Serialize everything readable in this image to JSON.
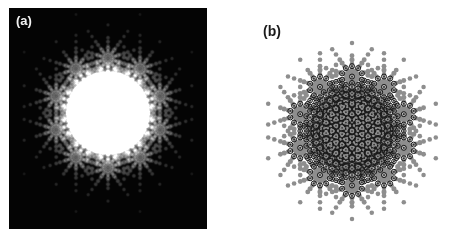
{
  "figure": {
    "width": 459,
    "height": 240,
    "background_color": "#ffffff",
    "type": "two-panel scientific figure of a decagonal quasicrystal diffraction pattern"
  },
  "panels": [
    {
      "id": "a",
      "label": "(a)",
      "label_color": "#f2f2f2",
      "kind": "experimental-electron-diffraction",
      "background_color": "#040404",
      "spot_color": "#f0f0f0",
      "rect": {
        "x": 9,
        "y": 8,
        "width": 198,
        "height": 221
      },
      "center": {
        "x": 99,
        "y": 105
      },
      "halo": {
        "radius": 34,
        "peak_brightness": 0.78
      }
    },
    {
      "id": "b",
      "label": "(b)",
      "label_color": "#1a1a1a",
      "kind": "calculated-indexed-pattern",
      "background_color": "#ffffff",
      "dot_color": "#111111",
      "ring_color": "#1a1a1a",
      "ring_fill_color": "#8e8e8e",
      "rect": {
        "x": 247,
        "y": 20,
        "width": 212,
        "height": 220
      },
      "center": {
        "x": 105,
        "y": 111
      },
      "radius": 99
    }
  ],
  "chart_data": {
    "type": "scatter",
    "xlabel": "",
    "ylabel": "",
    "symmetry_order": 10,
    "grid": false,
    "legend": null,
    "lattice": {
      "description": "Reciprocal-space quasilattice generated from five unit vectors at 72-degree increments, with amplitudes scaled by powers of the golden ratio tau = 1.618034",
      "basis_angles_deg": [
        90,
        162,
        234,
        306,
        18
      ],
      "golden_ratio": 1.618034,
      "base_spacing_px": 10.4,
      "tau_powers": [
        -2,
        -1,
        0,
        1,
        2
      ],
      "index_range": [
        -2,
        -1,
        0,
        1,
        2
      ]
    },
    "series": [
      {
        "name": "panel-a-spots",
        "marker": "blurred-gaussian-disc",
        "color": "#f0f0f0",
        "intensity_rule": "intensity falls with distance from the origin; spot radius scales with intensity; central direct-beam halo saturated",
        "n_points_approx": 300,
        "radius_range_px": [
          0.8,
          5.2
        ]
      },
      {
        "name": "panel-b-strong-reflections",
        "marker": "grey-disc-with-black-ring",
        "color": "#8e8e8e",
        "ring_color": "#1a1a1a",
        "n_points_approx": 120,
        "radius_range_px": [
          2.2,
          3.6
        ]
      },
      {
        "name": "panel-b-weak-reflections",
        "marker": "solid-black-dot",
        "color": "#111111",
        "n_points_approx": 260,
        "radius_range_px": [
          0.5,
          2.2
        ]
      }
    ]
  }
}
